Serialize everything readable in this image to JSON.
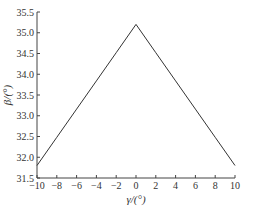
{
  "chart_data": {
    "type": "line",
    "title": "",
    "xlabel": "γ/(°)",
    "ylabel": "β/(°)",
    "xlim": [
      -10,
      10
    ],
    "ylim": [
      31.5,
      35.5
    ],
    "x_ticks": [
      -10,
      -8,
      -6,
      -4,
      -2,
      0,
      2,
      4,
      6,
      8,
      10
    ],
    "x_tick_labels": [
      "−10",
      "−8",
      "−6",
      "−4",
      "−2",
      "0",
      "2",
      "4",
      "6",
      "8",
      "10"
    ],
    "y_ticks": [
      31.5,
      32.0,
      32.5,
      33.0,
      33.5,
      34.0,
      34.5,
      35.0,
      35.5
    ],
    "y_tick_labels": [
      "31.5",
      "32.0",
      "32.5",
      "33.0",
      "33.5",
      "34.0",
      "34.5",
      "35.0",
      "35.5"
    ],
    "grid": false,
    "legend": null,
    "series": [
      {
        "name": "β",
        "color": "#333333",
        "x": [
          -10,
          -8,
          -6,
          -4,
          -2,
          0,
          2,
          4,
          6,
          8,
          10
        ],
        "values": [
          31.8,
          32.48,
          33.16,
          33.84,
          34.52,
          35.2,
          34.52,
          33.84,
          33.16,
          32.48,
          31.8
        ]
      }
    ]
  },
  "style": {
    "axis_color": "#444444",
    "line_color": "#333333"
  }
}
